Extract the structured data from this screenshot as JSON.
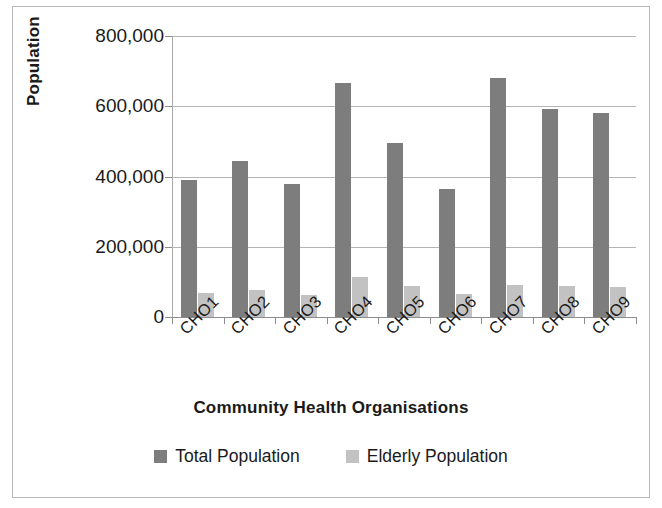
{
  "chart_data": {
    "type": "bar",
    "title": "",
    "xlabel": "Community Health Organisations",
    "ylabel": "Population",
    "categories": [
      "CHO1",
      "CHO2",
      "CHO3",
      "CHO4",
      "CHO5",
      "CHO6",
      "CHO7",
      "CHO8",
      "CHO9"
    ],
    "series": [
      {
        "name": "Total Population",
        "color": "#7d7d7d",
        "values": [
          390000,
          445000,
          380000,
          665000,
          495000,
          365000,
          680000,
          592000,
          582000
        ]
      },
      {
        "name": "Elderly Population",
        "color": "#c2c2c2",
        "values": [
          68000,
          78000,
          63000,
          113000,
          88000,
          65000,
          90000,
          88000,
          85000
        ]
      }
    ],
    "ylim": [
      0,
      800000
    ],
    "ytick_values": [
      0,
      200000,
      400000,
      600000,
      800000
    ],
    "ytick_labels": [
      "0",
      "200,000",
      "400,000",
      "600,000",
      "800,000"
    ],
    "grid": "horizontal",
    "legend_position": "bottom"
  }
}
